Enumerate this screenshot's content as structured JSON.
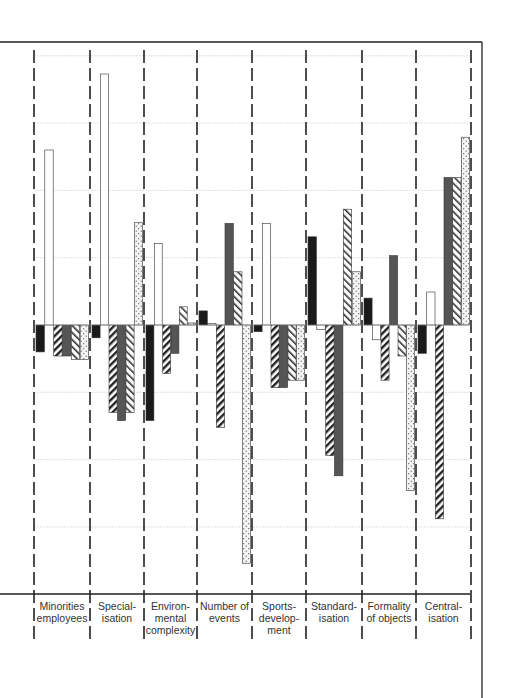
{
  "chart_data": {
    "type": "bar",
    "title": "",
    "xlabel": "",
    "ylabel": "",
    "categories": [
      "Minorities employees",
      "Special-isation",
      "Environ-mental complexity",
      "Number of events",
      "Sports-develop-ment",
      "Standard-isation",
      "Formality of objects",
      "Central-isation"
    ],
    "category_label_lines": [
      "Minorities\nemployees",
      "Special-\nisation",
      "Environ-\nmental\ncomplexity",
      "Number of\nevents",
      "Sports-\ndevelop-\nment",
      "Standard-\nisation",
      "Formality\nof objects",
      "Central-\nisation"
    ],
    "series": [
      {
        "name": "series-1-solid-black",
        "pattern": "solid-black",
        "values": [
          -0.4,
          -0.19,
          -1.42,
          0.21,
          -0.1,
          1.31,
          0.4,
          -0.42
        ]
      },
      {
        "name": "series-2-white",
        "pattern": "white",
        "values": [
          2.6,
          3.73,
          1.21,
          0.0,
          1.51,
          -0.07,
          -0.22,
          0.49
        ]
      },
      {
        "name": "series-3-diagonal-hatch",
        "pattern": "hatch-forward",
        "values": [
          -0.46,
          -1.3,
          -0.72,
          -1.52,
          -0.93,
          -1.94,
          -0.82,
          -2.88
        ]
      },
      {
        "name": "series-4-dark-gray",
        "pattern": "dark-gray",
        "values": [
          -0.46,
          -1.42,
          -0.42,
          1.51,
          -0.93,
          -2.24,
          1.03,
          2.19
        ]
      },
      {
        "name": "series-5-back-hatch",
        "pattern": "hatch-back",
        "values": [
          -0.51,
          -1.3,
          0.27,
          0.79,
          -0.82,
          1.72,
          -0.46,
          2.19
        ]
      },
      {
        "name": "series-6-dotted",
        "pattern": "dotted",
        "values": [
          -0.51,
          1.52,
          0.03,
          -3.54,
          -0.82,
          0.79,
          -2.46,
          2.79
        ]
      }
    ],
    "ylim": [
      -4,
      4
    ],
    "gridlines": [
      -4,
      -3,
      -2,
      -1,
      0,
      1,
      2,
      3,
      4
    ],
    "grid": true,
    "legend": "none",
    "colors": {
      "solid-black": "#1a1a1a",
      "dark-gray": "#555555",
      "outline": "#333333",
      "grid": "#d8d8d8",
      "axis": "#222222"
    }
  }
}
